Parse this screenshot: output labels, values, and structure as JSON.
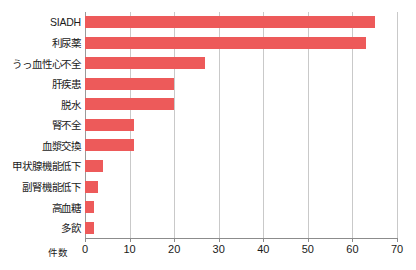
{
  "chart_data": {
    "type": "bar",
    "orientation": "horizontal",
    "title": "",
    "subtitle": "",
    "xlabel": "件数",
    "ylabel": "",
    "xlim": [
      0,
      70
    ],
    "xticks": [
      0,
      10,
      20,
      30,
      40,
      50,
      60,
      70
    ],
    "xtick_labels": [
      "0",
      "10",
      "20",
      "30",
      "40",
      "50",
      "60",
      "70"
    ],
    "grid": "vertical",
    "legend": "none",
    "bar_color": "#ed5a5a",
    "gridline_color": "#c9c9c9",
    "axis_color": "#8c8c8c",
    "categories": [
      "SIADH",
      "利尿薬",
      "うっ血性心不全",
      "肝疾患",
      "脱水",
      "腎不全",
      "血漿交換",
      "甲状腺機能低下",
      "副腎機能低下",
      "高血糖",
      "多飲"
    ],
    "values": [
      65,
      63,
      27,
      20,
      20,
      11,
      11,
      4,
      3,
      2,
      2
    ],
    "series": [
      {
        "name": "件数",
        "values": [
          65,
          63,
          27,
          20,
          20,
          11,
          11,
          4,
          3,
          2,
          2
        ]
      }
    ]
  }
}
